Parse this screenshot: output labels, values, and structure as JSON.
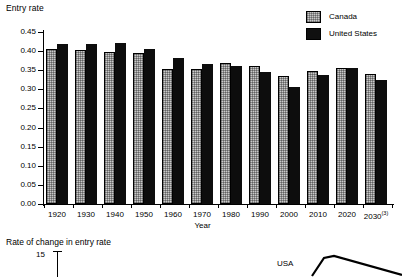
{
  "chart_data": [
    {
      "type": "bar",
      "title": "Entry rate",
      "xlabel": "Year",
      "ylabel": "Entry rate",
      "categories": [
        "1920",
        "1930",
        "1940",
        "1950",
        "1960",
        "1970",
        "1980",
        "1990",
        "2000",
        "2010",
        "2020",
        "2030"
      ],
      "category_notes": {
        "2030": "(3)"
      },
      "series": [
        {
          "name": "Canada",
          "color": "#c9c9c9",
          "values": [
            0.405,
            0.404,
            0.398,
            0.396,
            0.354,
            0.352,
            0.37,
            0.362,
            0.336,
            0.348,
            0.357,
            0.34
          ]
        },
        {
          "name": "United States",
          "color": "#0d0d0d",
          "values": [
            0.418,
            0.419,
            0.422,
            0.406,
            0.381,
            0.367,
            0.361,
            0.346,
            0.307,
            0.338,
            0.357,
            0.324
          ]
        }
      ],
      "ylim": [
        0.0,
        0.45
      ],
      "yticks": [
        "0.00",
        "0.05",
        "0.10",
        "0.15",
        "0.20",
        "0.25",
        "0.30",
        "0.35",
        "0.40",
        "0.45"
      ],
      "grid": false,
      "legend_position": "top-right",
      "legend_entries": [
        "Canada",
        "United States"
      ]
    },
    {
      "type": "line",
      "title": "Rate of change in entry rate",
      "yticks": [
        "15"
      ],
      "annotations": [
        "USA"
      ],
      "cropped": true
    }
  ],
  "top_chart": {
    "axis_title": "Entry rate",
    "x_axis_title": "Year",
    "legend": {
      "canada_label": "Canada",
      "united_states_label": "United States"
    }
  },
  "bottom_chart": {
    "title": "Rate of change in entry rate",
    "y_tick_label": "15",
    "series_label": "USA"
  }
}
